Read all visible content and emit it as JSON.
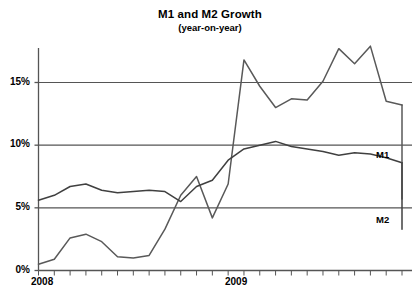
{
  "chart_data": {
    "type": "line",
    "title": "M1 and M2 Growth",
    "subtitle": "(year-on-year)",
    "xlabel": "",
    "ylabel": "",
    "ylim": [
      -1.2,
      19.6
    ],
    "xlim": [
      0,
      23
    ],
    "grid": "horizontal-at-y-ticks",
    "legend_position": "inline-right-end-labels",
    "ytick_labels": [
      "0%",
      "5%",
      "10%",
      "15%"
    ],
    "ytick_values": [
      0,
      5,
      10,
      15
    ],
    "xtick_labels": [
      "2008",
      "2009"
    ],
    "xtick_positions": [
      0,
      12
    ],
    "x_minor_ticks": 24,
    "x": [
      0,
      1,
      2,
      3,
      4,
      5,
      6,
      7,
      8,
      9,
      10,
      11,
      12,
      13,
      14,
      15,
      16,
      17,
      18,
      19,
      20,
      21,
      22,
      23
    ],
    "series": [
      {
        "name": "M1",
        "label": "M1",
        "color": "#595959",
        "values": [
          0.5,
          0.9,
          2.6,
          2.9,
          2.3,
          1.1,
          1.0,
          1.2,
          3.3,
          6.0,
          7.5,
          4.2,
          6.9,
          16.8,
          14.7,
          13.0,
          13.7,
          13.6,
          15.1,
          17.7,
          16.5,
          17.9,
          13.5,
          13.2
        ]
      },
      {
        "name": "M2",
        "label": "M2",
        "color": "#404040",
        "values": [
          5.6,
          6.0,
          6.7,
          6.9,
          6.4,
          6.2,
          6.3,
          6.4,
          6.3,
          5.5,
          6.7,
          7.2,
          8.8,
          9.7,
          10.0,
          10.3,
          9.9,
          9.7,
          9.5,
          9.2,
          9.4,
          9.3,
          9.0,
          8.6
        ]
      }
    ],
    "series_tail": [
      {
        "name": "M1",
        "values": [
          13.2,
          5.7
        ]
      },
      {
        "name": "M2",
        "values": [
          8.6,
          3.3
        ]
      }
    ]
  },
  "axis": {
    "y_label_0": "0%",
    "y_label_5": "5%",
    "y_label_10": "10%",
    "y_label_15": "15%",
    "x_label_2008": "2008",
    "x_label_2009": "2009"
  },
  "labels": {
    "m1": "M1",
    "m2": "M2"
  },
  "colors": {
    "axis": "#555555",
    "grid": "#555555",
    "m1_line": "#595959",
    "m2_line": "#404040",
    "text": "#000000",
    "background": "#ffffff"
  }
}
